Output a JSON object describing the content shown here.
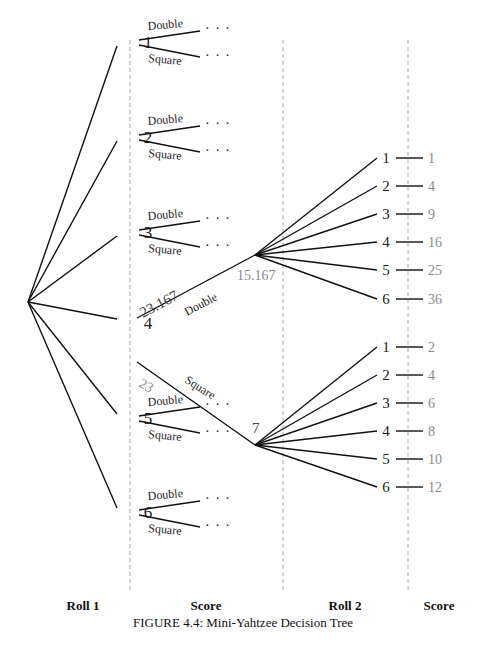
{
  "figure": {
    "caption": "FIGURE 4.4: Mini-Yahtzee Decision Tree",
    "columns": [
      {
        "label": "Roll 1",
        "x": 60
      },
      {
        "label": "Score",
        "x": 206
      },
      {
        "label": "Roll 2",
        "x": 345
      },
      {
        "label": "Score",
        "x": 440
      }
    ]
  },
  "tree": {
    "root": {
      "x": 28,
      "y": 302
    },
    "roll1": [
      {
        "label": "1",
        "y": 42,
        "double": "Double",
        "square": "Square",
        "dots": "· · ·"
      },
      {
        "label": "2",
        "y": 137,
        "double": "Double",
        "square": "Square",
        "dots": "· · ·"
      },
      {
        "label": "3",
        "y": 232,
        "double": "Double",
        "square": "Square",
        "dots": "· · ·"
      },
      {
        "label": "4",
        "y": 323
      },
      {
        "label": "5",
        "y": 418,
        "double": "Double",
        "square": "Square",
        "dots": "· · ·"
      },
      {
        "label": "6",
        "y": 512,
        "double": "Double",
        "square": "Square",
        "dots": "· · ·"
      }
    ],
    "expanded": {
      "from": "4",
      "double_branch": {
        "label": "Double",
        "value_on_edge": "23.167",
        "node_value": "15.167"
      },
      "square_branch": {
        "label": "Square",
        "value_on_edge": "23",
        "node_value": "7"
      }
    },
    "roll2_double": [
      {
        "roll": "1",
        "score": "1"
      },
      {
        "roll": "2",
        "score": "4"
      },
      {
        "roll": "3",
        "score": "9"
      },
      {
        "roll": "4",
        "score": "16"
      },
      {
        "roll": "5",
        "score": "25"
      },
      {
        "roll": "6",
        "score": "36"
      }
    ],
    "roll2_square": [
      {
        "roll": "1",
        "score": "2"
      },
      {
        "roll": "2",
        "score": "4"
      },
      {
        "roll": "3",
        "score": "6"
      },
      {
        "roll": "4",
        "score": "8"
      },
      {
        "roll": "5",
        "score": "10"
      },
      {
        "roll": "6",
        "score": "12"
      }
    ]
  },
  "colors": {
    "edge": "#111111",
    "divider": "#aaaaaa",
    "score_text": "#8a8a8a"
  }
}
